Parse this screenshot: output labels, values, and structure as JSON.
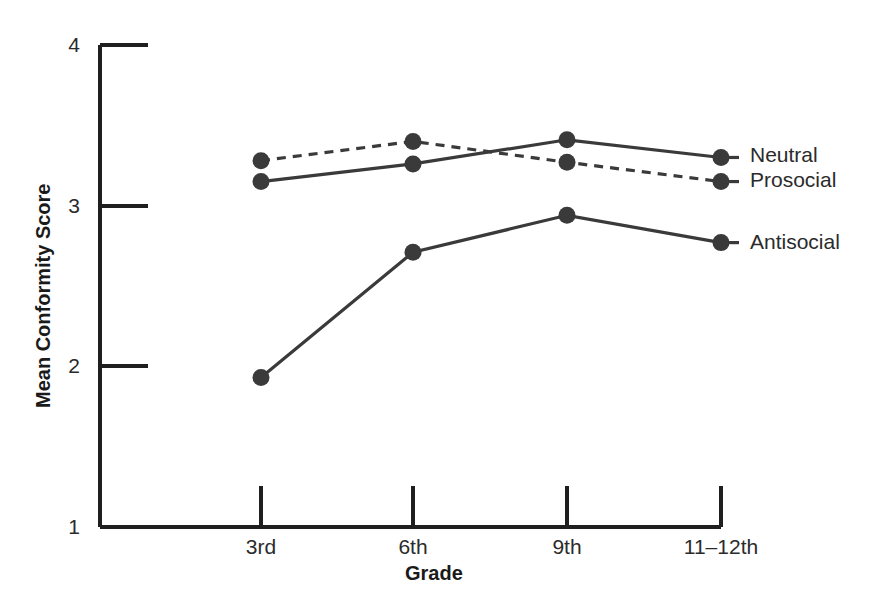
{
  "chart_data": {
    "type": "line",
    "title": "",
    "xlabel": "Grade",
    "ylabel": "Mean Conformity Score",
    "categories": [
      "3rd",
      "6th",
      "9th",
      "11–12th"
    ],
    "ylim": [
      1,
      4
    ],
    "yticks": [
      1,
      2,
      3,
      4
    ],
    "ytick_labels": [
      "1",
      "2",
      "3",
      "4"
    ],
    "grid": false,
    "legend_position": "right-inline-labels",
    "series": [
      {
        "name": "Neutral",
        "style": "solid",
        "color": "#3a3a3a",
        "marker": "circle",
        "values": [
          3.15,
          3.26,
          3.41,
          3.3
        ]
      },
      {
        "name": "Prosocial",
        "style": "dashed",
        "color": "#3a3a3a",
        "marker": "circle",
        "values": [
          3.28,
          3.4,
          3.27,
          3.15
        ]
      },
      {
        "name": "Antisocial",
        "style": "solid",
        "color": "#3a3a3a",
        "marker": "circle",
        "values": [
          1.93,
          2.71,
          2.94,
          2.77
        ]
      }
    ]
  },
  "axes": {
    "y_title": "Mean Conformity Score",
    "x_title": "Grade",
    "y_tick_1": "1",
    "y_tick_2": "2",
    "y_tick_3": "3",
    "y_tick_4": "4",
    "x_tick_1": "3rd",
    "x_tick_2": "6th",
    "x_tick_3": "9th",
    "x_tick_4": "11–12th"
  },
  "legend": {
    "neutral": "Neutral",
    "prosocial": "Prosocial",
    "antisocial": "Antisocial"
  },
  "colors": {
    "line": "#3a3a3a",
    "axis": "#1f1f1f",
    "text": "#2b2b2b"
  }
}
